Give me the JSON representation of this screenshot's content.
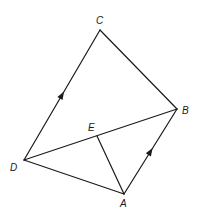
{
  "diagram": {
    "points": {
      "A": {
        "label": "A"
      },
      "B": {
        "label": "B"
      },
      "C": {
        "label": "C"
      },
      "D": {
        "label": "D"
      },
      "E": {
        "label": "E"
      }
    },
    "segments": [
      {
        "from": "D",
        "to": "C",
        "arrow": true
      },
      {
        "from": "C",
        "to": "B",
        "arrow": false
      },
      {
        "from": "D",
        "to": "B",
        "arrow": false
      },
      {
        "from": "D",
        "to": "A",
        "arrow": false
      },
      {
        "from": "A",
        "to": "B",
        "arrow": true
      },
      {
        "from": "E",
        "to": "A",
        "arrow": false
      }
    ],
    "parallel_marked": [
      [
        "D",
        "C"
      ],
      [
        "A",
        "B"
      ]
    ],
    "point_on_segment": {
      "point": "E",
      "segment": [
        "D",
        "B"
      ]
    }
  }
}
